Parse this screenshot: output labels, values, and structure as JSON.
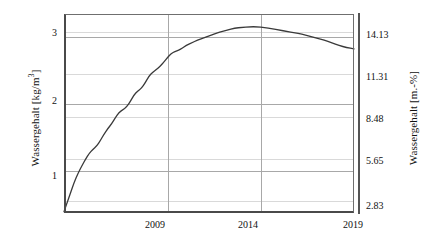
{
  "figure": {
    "background_color": "#ffffff",
    "line_color": "#3a3a3a",
    "grid_color": "#d9d9d9",
    "axis_color": "#4a4a4a"
  },
  "axes": {
    "left": {
      "title": "Wassergehalt [kg/m",
      "title_sup": "3",
      "title_suffix": "]",
      "ticks": [
        "1",
        "2",
        "3"
      ]
    },
    "right": {
      "title": "Wassergehalt [m.-%]",
      "ticks": [
        "2.83",
        "5.65",
        "8.48",
        "11.31",
        "14.13"
      ]
    },
    "bottom": {
      "ticks": [
        "2009",
        "2014",
        "2019"
      ]
    }
  },
  "chart_data": {
    "type": "line",
    "title": "",
    "xlabel": "",
    "ylabel": "Wassergehalt [kg/m3]",
    "ylabel_secondary": "Wassergehalt [m.-%]",
    "xlim": [
      2003.45,
      2019.0
    ],
    "ylim": [
      0.38,
      3.35
    ],
    "ylim_secondary": [
      2.05,
      15.35
    ],
    "xticks": [
      2009,
      2014,
      2019
    ],
    "yticks": [
      1,
      2,
      3
    ],
    "yticks_secondary": [
      2.83,
      5.65,
      8.48,
      11.31,
      14.13
    ],
    "grid": true,
    "legend": null,
    "series": [
      {
        "name": "Wassergehalt",
        "x": [
          2003.45,
          2003.6,
          2003.8,
          2004.0,
          2004.2,
          2004.4,
          2004.6,
          2004.8,
          2005.0,
          2005.2,
          2005.4,
          2005.6,
          2005.8,
          2006.0,
          2006.2,
          2006.4,
          2006.6,
          2006.8,
          2007.0,
          2007.2,
          2007.4,
          2007.6,
          2007.8,
          2008.0,
          2008.2,
          2008.4,
          2008.6,
          2008.8,
          2009.0,
          2009.2,
          2009.4,
          2009.6,
          2009.8,
          2010.0,
          2010.3,
          2010.6,
          2011.0,
          2011.4,
          2011.8,
          2012.2,
          2012.6,
          2013.0,
          2013.4,
          2013.8,
          2014.2,
          2014.6,
          2015.0,
          2015.4,
          2015.8,
          2016.2,
          2016.6,
          2017.0,
          2017.4,
          2017.8,
          2018.2,
          2018.6,
          2019.0
        ],
        "y": [
          0.4,
          0.52,
          0.68,
          0.84,
          0.97,
          1.08,
          1.18,
          1.27,
          1.33,
          1.38,
          1.46,
          1.56,
          1.64,
          1.71,
          1.8,
          1.88,
          1.92,
          1.96,
          2.04,
          2.14,
          2.2,
          2.24,
          2.32,
          2.42,
          2.48,
          2.52,
          2.57,
          2.63,
          2.7,
          2.76,
          2.79,
          2.81,
          2.84,
          2.88,
          2.92,
          2.96,
          3.0,
          3.04,
          3.08,
          3.11,
          3.14,
          3.15,
          3.16,
          3.16,
          3.15,
          3.13,
          3.11,
          3.09,
          3.07,
          3.05,
          3.02,
          2.99,
          2.96,
          2.92,
          2.88,
          2.85,
          2.83
        ]
      }
    ]
  }
}
